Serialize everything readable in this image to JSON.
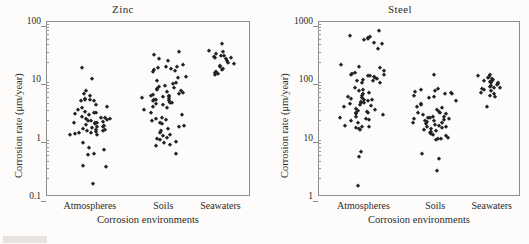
{
  "figure": {
    "background_color": "#fdfcfa",
    "marker_color": "#232323",
    "axis_color": "#8d8d8d",
    "caption_fragment": ""
  },
  "chart_data": [
    {
      "type": "scatter",
      "title": "Zinc",
      "xlabel": "Corrosion environments",
      "ylabel": "Corrosion rate (μm/year)",
      "yscale": "log",
      "ylim": [
        0.1,
        100
      ],
      "yticks": [
        0.1,
        1,
        10,
        100
      ],
      "ytick_labels": [
        "0.1",
        "1",
        "10",
        "100"
      ],
      "grid": false,
      "legend": "none",
      "categories": [
        "Atmospheres",
        "Soils",
        "Seawaters"
      ],
      "series": [
        {
          "name": "Atmospheres",
          "category": "Atmospheres",
          "values": [
            15.5,
            10.2,
            6.2,
            5.6,
            5.2,
            4.6,
            4.5,
            4.4,
            4.3,
            4.2,
            3.6,
            3.4,
            3.2,
            3.0,
            2.8,
            2.7,
            2.6,
            2.5,
            2.4,
            2.3,
            2.2,
            2.15,
            2.1,
            2.05,
            2.0,
            1.95,
            1.9,
            1.85,
            1.8,
            1.78,
            1.75,
            1.7,
            1.65,
            1.6,
            1.55,
            1.5,
            1.45,
            1.4,
            1.38,
            1.35,
            1.3,
            1.28,
            1.25,
            1.2,
            1.18,
            1.15,
            1.12,
            1.1,
            0.82,
            0.67,
            0.62,
            0.52,
            0.5,
            0.33,
            0.32,
            0.16
          ]
        },
        {
          "name": "Soils",
          "category": "Soils",
          "values": [
            26.0,
            29.0,
            22.0,
            21.0,
            17.5,
            16.5,
            16.0,
            15.5,
            15.0,
            14.5,
            14.0,
            13.5,
            11.0,
            10.5,
            9.5,
            8.8,
            8.2,
            7.8,
            7.4,
            7.0,
            6.8,
            6.5,
            6.2,
            6.0,
            5.8,
            5.6,
            5.4,
            5.2,
            5.1,
            5.0,
            4.9,
            4.8,
            4.6,
            4.5,
            4.4,
            4.3,
            4.2,
            4.0,
            3.9,
            3.8,
            3.6,
            3.4,
            3.2,
            3.0,
            2.6,
            2.4,
            2.2,
            2.1,
            2.0,
            1.9,
            1.8,
            1.7,
            1.6,
            1.5,
            1.4,
            1.3,
            1.2,
            1.1,
            1.05,
            1.0,
            0.95,
            0.9,
            0.85,
            0.8,
            0.75,
            0.72,
            0.52
          ]
        },
        {
          "name": "Seawaters",
          "category": "Seawaters",
          "values": [
            41.0,
            31.0,
            30.0,
            27.0,
            25.5,
            25.0,
            24.0,
            23.5,
            23.0,
            22.0,
            21.0,
            19.0,
            18.0,
            17.0,
            16.5,
            15.0,
            14.5,
            13.5,
            13.0,
            12.5,
            12.0
          ]
        }
      ]
    },
    {
      "type": "scatter",
      "title": "Steel",
      "xlabel": "Corrosion environments",
      "ylabel": "Corrosion rate (μm/year)",
      "yscale": "log",
      "ylim": [
        1,
        1000
      ],
      "yticks": [
        1,
        10,
        100,
        1000
      ],
      "ytick_labels": [
        "1",
        "10",
        "100",
        "1000"
      ],
      "grid": false,
      "legend": "none",
      "categories": [
        "Atmospheres",
        "Soils",
        "Seawaters"
      ],
      "series": [
        {
          "name": "Atmospheres",
          "category": "Atmospheres",
          "values": [
            680.0,
            560.0,
            540.0,
            520.0,
            500.0,
            480.0,
            420.0,
            400.0,
            330.0,
            175.0,
            165.0,
            155.0,
            140.0,
            130.0,
            125.0,
            120.0,
            118.0,
            115.0,
            112.0,
            108.0,
            105.0,
            100.0,
            98.0,
            95.0,
            92.0,
            88.0,
            85.0,
            70.0,
            66.0,
            62.0,
            58.0,
            55.0,
            52.0,
            50.0,
            48.0,
            46.0,
            45.0,
            44.0,
            42.0,
            41.0,
            40.0,
            39.0,
            38.0,
            36.0,
            35.0,
            33.0,
            31.0,
            30.0,
            29.0,
            28.0,
            27.0,
            26.0,
            25.0,
            24.0,
            23.0,
            22.0,
            21.0,
            20.0,
            19.0,
            18.0,
            16.0,
            15.5,
            15.0,
            14.5,
            14.0,
            13.5,
            5.6,
            4.6,
            1.5
          ]
        },
        {
          "name": "Soils",
          "category": "Soils",
          "values": [
            120.0,
            68.0,
            65.0,
            62.0,
            60.0,
            58.0,
            56.0,
            55.0,
            52.0,
            50.0,
            48.0,
            42.0,
            38.0,
            36.0,
            34.0,
            32.0,
            30.0,
            28.0,
            27.0,
            26.0,
            25.0,
            24.0,
            23.0,
            22.5,
            22.0,
            21.5,
            21.0,
            20.5,
            20.0,
            19.5,
            19.0,
            18.5,
            18.0,
            17.5,
            17.0,
            16.5,
            16.0,
            15.5,
            15.0,
            14.5,
            14.0,
            13.5,
            13.0,
            12.5,
            12.0,
            11.5,
            11.0,
            10.5,
            10.0,
            9.6,
            9.4,
            9.2,
            5.2,
            4.3,
            2.7
          ]
        },
        {
          "name": "Seawaters",
          "category": "Seawaters",
          "values": [
            120.0,
            115.0,
            110.0,
            105.0,
            100.0,
            98.0,
            95.0,
            92.0,
            90.0,
            88.0,
            85.0,
            82.0,
            80.0,
            78.0,
            75.0,
            72.0,
            70.0,
            68.0,
            65.0,
            62.0,
            58.0,
            55.0,
            52.0,
            50.0,
            34.0
          ]
        }
      ]
    }
  ]
}
